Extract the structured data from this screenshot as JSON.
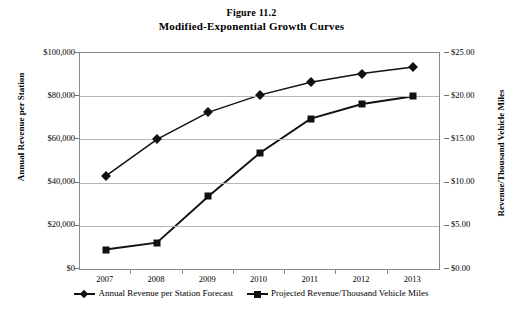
{
  "figure": {
    "number": "Figure 11.2",
    "title": "Modified-Exponential Growth Curves"
  },
  "chart_data": {
    "type": "line",
    "title": "Modified-Exponential Growth Curves",
    "subtitle": "Figure 11.2",
    "xlabel": "",
    "ylabel": "Annual Revenue per Station",
    "y2label": "Revenue/Thousand Vehicle Miles",
    "categories": [
      "2007",
      "2008",
      "2009",
      "2010",
      "2011",
      "2012",
      "2013"
    ],
    "ylim": [
      0,
      100000
    ],
    "y2lim": [
      0,
      25
    ],
    "yticks": [
      "$0",
      "$20,000",
      "$40,000",
      "$60,000",
      "$80,000",
      "$100,000"
    ],
    "y2ticks": [
      "$0.00",
      "$5.00",
      "$10.00",
      "$15.00",
      "$20.00",
      "$25.00"
    ],
    "grid": true,
    "legend_position": "bottom",
    "series": [
      {
        "name": "Annual Revenue per Station Forecast",
        "marker": "diamond",
        "axis": "left",
        "values": [
          43000,
          60000,
          72500,
          80500,
          86500,
          90500,
          93500
        ]
      },
      {
        "name": "Projected Revenue/Thousand Vehicle Miles",
        "marker": "square",
        "axis": "right",
        "values": [
          2.25,
          3.05,
          8.4,
          13.4,
          17.4,
          19.1,
          20.0
        ]
      }
    ]
  },
  "legend": {
    "items": [
      {
        "label": "Annual Revenue per Station Forecast",
        "marker": "diamond"
      },
      {
        "label": "Projected Revenue/Thousand Vehicle Miles",
        "marker": "square"
      }
    ]
  },
  "colors": {
    "line": "#111111",
    "grid": "#b5b5b5",
    "frame": "#8a8a8a",
    "background": "#ffffff"
  }
}
